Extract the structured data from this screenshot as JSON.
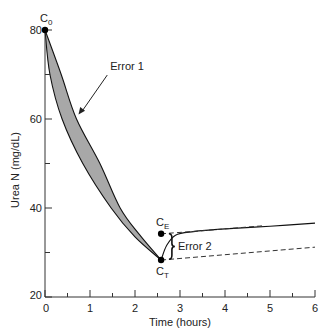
{
  "chart_data": {
    "type": "line",
    "title": "",
    "xlabel": "Time (hours)",
    "ylabel": "Urea N (mg/dL)",
    "xlim": [
      0,
      6
    ],
    "ylim": [
      20,
      80
    ],
    "x_ticks_major": [
      0,
      1,
      2,
      3,
      4,
      5,
      6
    ],
    "x_ticks_minor": [
      0.5,
      1.5,
      2.5,
      3.5,
      4.5,
      5.5
    ],
    "y_ticks_major": [
      20,
      40,
      60,
      80
    ],
    "y_ticks_minor": [
      30,
      50,
      70
    ],
    "x_tick_labels": [
      "0",
      "1",
      "2",
      "3",
      "4",
      "5",
      "6"
    ],
    "y_tick_labels": [
      "20",
      "40",
      "60",
      "80"
    ],
    "grid": false,
    "series": [
      {
        "name": "single-pool decline (upper)",
        "style": "solid",
        "points": [
          [
            0,
            80
          ],
          [
            0.36,
            70
          ],
          [
            0.7,
            60
          ],
          [
            1.22,
            50
          ],
          [
            1.67,
            40
          ],
          [
            2.1,
            34
          ],
          [
            2.58,
            28.3
          ]
        ]
      },
      {
        "name": "true decline (lower)",
        "style": "solid",
        "points": [
          [
            0,
            80
          ],
          [
            0.11,
            70
          ],
          [
            0.38,
            60
          ],
          [
            0.84,
            50
          ],
          [
            1.47,
            40
          ],
          [
            2.0,
            33.5
          ],
          [
            2.58,
            28.3
          ]
        ]
      },
      {
        "name": "post-dialysis rebound",
        "style": "solid",
        "points": [
          [
            2.58,
            28.3
          ],
          [
            2.7,
            31.5
          ],
          [
            2.9,
            33.9
          ],
          [
            3.3,
            34.7
          ],
          [
            4.0,
            35.3
          ],
          [
            5.0,
            35.9
          ],
          [
            6.0,
            36.6
          ]
        ]
      },
      {
        "name": "equilibrated projection",
        "style": "dashed",
        "points": [
          [
            2.58,
            34.2
          ],
          [
            3.5,
            34.9
          ],
          [
            4.84,
            36.0
          ]
        ]
      },
      {
        "name": "non-equilibrated projection",
        "style": "dashed",
        "points": [
          [
            2.58,
            28.3
          ],
          [
            6.0,
            31.2
          ]
        ]
      }
    ],
    "shaded_region": {
      "between": [
        "single-pool decline (upper)",
        "true decline (lower)"
      ],
      "color": "#a8a8a8",
      "label": "Error 1"
    },
    "points": [
      {
        "label": "C",
        "subscript": "0",
        "x": 0,
        "y": 80
      },
      {
        "label": "C",
        "subscript": "E",
        "x": 2.58,
        "y": 34.2
      },
      {
        "label": "C",
        "subscript": "T",
        "x": 2.58,
        "y": 28.3
      }
    ],
    "annotations": [
      {
        "text": "Error 1",
        "arrow_to": [
          0.7,
          61
        ],
        "text_at": [
          1.45,
          71
        ]
      },
      {
        "text": "Error 2",
        "brace_span": [
          28.5,
          34.2
        ],
        "brace_x": 2.82
      }
    ]
  }
}
